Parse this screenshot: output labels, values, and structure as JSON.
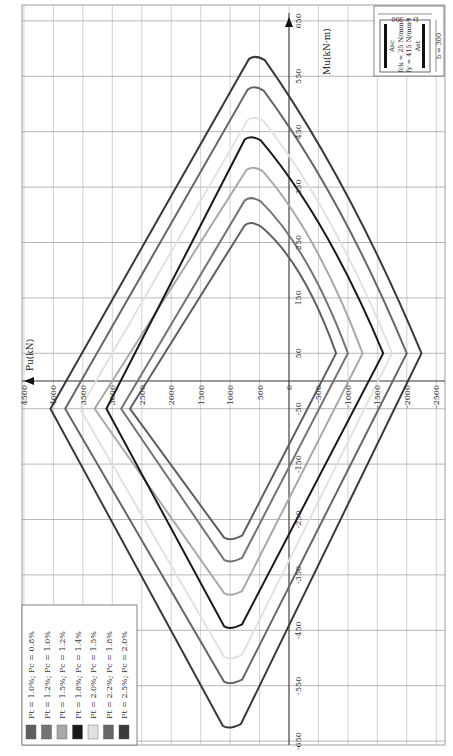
{
  "chart_data": {
    "type": "line",
    "title": "",
    "orientation": "rotated 90° (Pu axis horizontal, Mu axis vertical)",
    "xlabel": "Pu (kN)",
    "ylabel": "Mu (kN·m)",
    "pu_ticks": [
      4500,
      4000,
      3500,
      3000,
      2500,
      2000,
      1500,
      1000,
      500,
      0,
      -500,
      -1000,
      -1500,
      -2000,
      -2500
    ],
    "mu_ticks": [
      650,
      550,
      450,
      350,
      250,
      150,
      50,
      -50,
      -150,
      -250,
      -350,
      -450,
      -550,
      -650
    ],
    "pu_range": [
      4500,
      -2500
    ],
    "mu_range": [
      -650,
      650
    ],
    "grid": true,
    "legend_position": "bottom-left",
    "series": [
      {
        "name": "Pt = 1.0%; Pc = 0.8%",
        "color": "#5f5f5f",
        "p_max": 2700,
        "p_min": -800,
        "m_pos_max": 290,
        "p_at_m_pos": 650,
        "m_neg_max": -290,
        "p_at_m_neg": 1000
      },
      {
        "name": "Pt = 1.2%; Pc = 1.0%",
        "color": "#737373",
        "p_max": 2850,
        "p_min": -1000,
        "m_pos_max": 335,
        "p_at_m_pos": 650,
        "m_neg_max": -330,
        "p_at_m_neg": 1000
      },
      {
        "name": "Pt = 1.5%; Pc = 1.2%",
        "color": "#a8a8a8",
        "p_max": 3300,
        "p_min": -1250,
        "m_pos_max": 390,
        "p_at_m_pos": 620,
        "m_neg_max": -390,
        "p_at_m_neg": 1000
      },
      {
        "name": "Pt = 1.8%; Pc = 1.4%",
        "color": "#1a1a1a",
        "p_max": 3100,
        "p_min": -1600,
        "m_pos_max": 445,
        "p_at_m_pos": 650,
        "m_neg_max": -450,
        "p_at_m_neg": 1000
      },
      {
        "name": "Pt = 2.0%; Pc = 1.5%",
        "color": "#e2e2e2",
        "p_max": 3550,
        "p_min": -1750,
        "m_pos_max": 480,
        "p_at_m_pos": 600,
        "m_neg_max": -505,
        "p_at_m_neg": 1000
      },
      {
        "name": "Pt = 2.2%; Pc = 1.8%",
        "color": "#666666",
        "p_max": 3800,
        "p_min": -2000,
        "m_pos_max": 535,
        "p_at_m_pos": 600,
        "m_neg_max": -550,
        "p_at_m_neg": 1000
      },
      {
        "name": "Pt = 2.5%; Pc = 2.0%",
        "color": "#3a3a3a",
        "p_max": 4050,
        "p_min": -2250,
        "m_pos_max": 590,
        "p_at_m_pos": 580,
        "m_neg_max": -630,
        "p_at_m_neg": 1020
      }
    ],
    "annotations": {
      "section_b": "b = 300",
      "section_D": "D = 500",
      "fck": "fck = 25 N/mm²",
      "fy": "fy = 415 N/mm²",
      "asc": "Asc",
      "ast": "Ast"
    }
  },
  "labels": {
    "pu_axis": "Pu(kN)",
    "mu_axis": "Mu(kN·m)"
  }
}
